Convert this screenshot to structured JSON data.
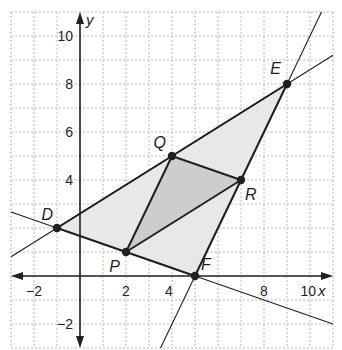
{
  "diagram": {
    "type": "coordinate-plane-triangle",
    "colors": {
      "outer_fill": "#e8e8e8",
      "inner_fill": "#cdcdcd",
      "grid": "#a8a8a8",
      "line": "#231f20",
      "background": "#ffffff"
    },
    "axes": {
      "x_label": "x",
      "y_label": "y",
      "x_range": [
        -3,
        11
      ],
      "y_range": [
        -3,
        11
      ],
      "x_ticks": [
        {
          "value": -2,
          "label": "−2"
        },
        {
          "value": 2,
          "label": "2"
        },
        {
          "value": 4,
          "label": "4"
        },
        {
          "value": 8,
          "label": "8"
        },
        {
          "value": 10,
          "label": "10"
        }
      ],
      "y_ticks": [
        {
          "value": 10,
          "label": "10"
        },
        {
          "value": 8,
          "label": "8"
        },
        {
          "value": 6,
          "label": "6"
        },
        {
          "value": 4,
          "label": "4"
        },
        {
          "value": -2,
          "label": "−2"
        }
      ],
      "grid": true
    },
    "points": {
      "D": {
        "label": "D",
        "x": -1,
        "y": 2
      },
      "E": {
        "label": "E",
        "x": 9,
        "y": 8
      },
      "F": {
        "label": "F",
        "x": 5,
        "y": 0
      },
      "P": {
        "label": "P",
        "x": 2,
        "y": 1
      },
      "Q": {
        "label": "Q",
        "x": 4,
        "y": 5
      },
      "R": {
        "label": "R",
        "x": 7,
        "y": 4
      }
    },
    "outer_triangle": [
      "D",
      "E",
      "F"
    ],
    "inner_triangle": [
      "P",
      "Q",
      "R"
    ],
    "extended_lines": [
      "DE",
      "DF",
      "EF"
    ]
  }
}
